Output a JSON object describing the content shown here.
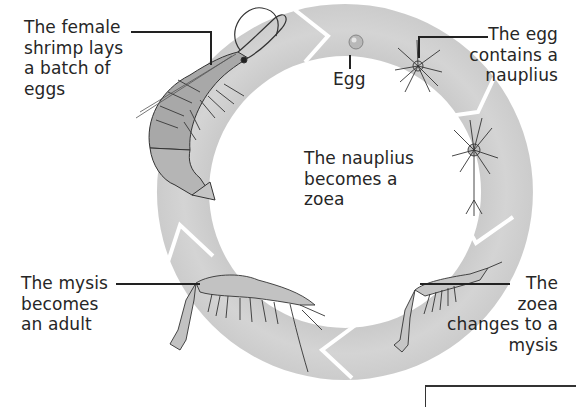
{
  "diagram": {
    "type": "life-cycle",
    "subject": "shrimp",
    "colors": {
      "ring": "#cfcfcf",
      "ring_shade": "#bdbdbd",
      "separator": "#ffffff",
      "text": "#262626",
      "leader_line": "#222222",
      "background": "#ffffff"
    },
    "stages": [
      {
        "id": "adult-lays-eggs",
        "illustration": "adult-female-shrimp",
        "label_lines": [
          "The female",
          "shrimp lays",
          "a batch of",
          "eggs"
        ]
      },
      {
        "id": "egg",
        "illustration": "egg",
        "label_lines": [
          "Egg"
        ]
      },
      {
        "id": "egg-nauplius",
        "illustration": "nauplius-in-egg",
        "label_lines": [
          "The egg",
          "contains a",
          "nauplius"
        ]
      },
      {
        "id": "nauplius-zoea",
        "illustration": "zoea-larva",
        "label_lines": [
          "The nauplius",
          "becomes a",
          "zoea"
        ]
      },
      {
        "id": "zoea-mysis",
        "illustration": "mysis-larva",
        "label_lines": [
          "The",
          "zoea",
          "changes to a",
          "mysis"
        ]
      },
      {
        "id": "mysis-adult",
        "illustration": "juvenile-shrimp",
        "label_lines": [
          "The mysis",
          "becomes",
          "an adult"
        ]
      }
    ]
  }
}
